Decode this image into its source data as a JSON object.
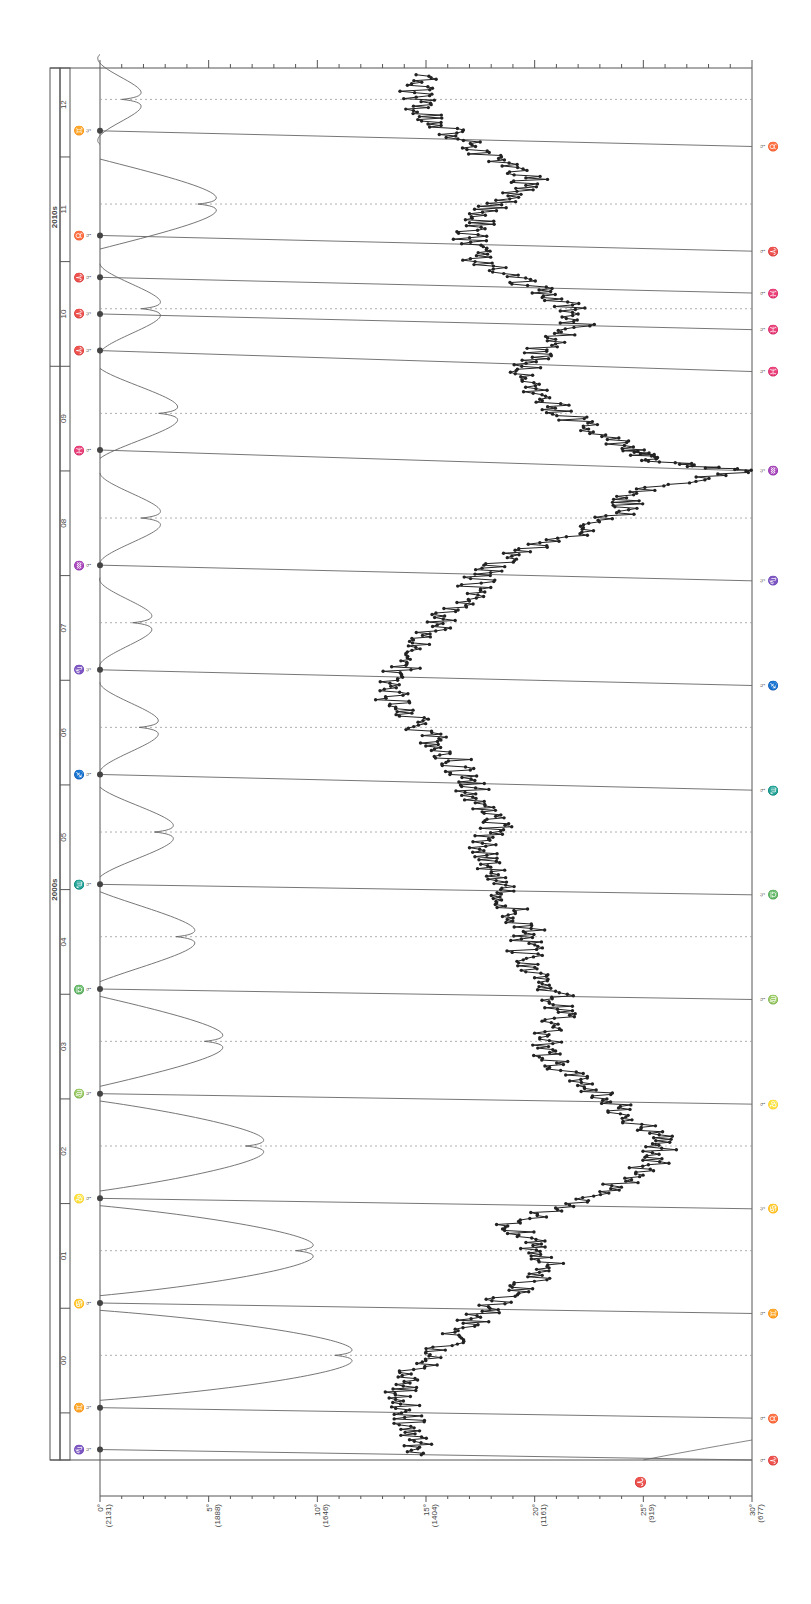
{
  "chart_data": {
    "type": "line",
    "orientation": "rotated-90",
    "title": "",
    "xlabel": "Year",
    "ylabel": "Degrees (price)",
    "decades": [
      {
        "label": "2000s",
        "from": 2000,
        "to": 2010
      },
      {
        "label": "2010s",
        "from": 2010,
        "to": 2013
      }
    ],
    "year_ticks": [
      "00",
      "01",
      "02",
      "03",
      "04",
      "05",
      "06",
      "07",
      "08",
      "09",
      "10",
      "11",
      "12"
    ],
    "y_ticks": [
      {
        "deg": "0°",
        "price": "(2131)"
      },
      {
        "deg": "5°",
        "price": "(1888)"
      },
      {
        "deg": "10°",
        "price": "(1646)"
      },
      {
        "deg": "15°",
        "price": "(1404)"
      },
      {
        "deg": "20°",
        "price": "(1161)"
      },
      {
        "deg": "25°",
        "price": "(919)"
      },
      {
        "deg": "30°",
        "price": "(677)"
      }
    ],
    "ylim": [
      0,
      30
    ],
    "xlim": [
      1999.55,
      2012.85
    ],
    "price_series": {
      "name": "Price (in degrees)",
      "x": [
        1999.6,
        1999.8,
        2000.0,
        2000.2,
        2000.4,
        2000.6,
        2000.8,
        2001.0,
        2001.2,
        2001.4,
        2001.6,
        2001.8,
        2002.0,
        2002.2,
        2002.4,
        2002.6,
        2002.8,
        2003.0,
        2003.2,
        2003.4,
        2003.6,
        2003.8,
        2004.0,
        2004.2,
        2004.4,
        2004.6,
        2004.8,
        2005.0,
        2005.2,
        2005.4,
        2005.6,
        2005.8,
        2006.0,
        2006.2,
        2006.4,
        2006.6,
        2006.8,
        2007.0,
        2007.2,
        2007.4,
        2007.6,
        2007.8,
        2008.0,
        2008.2,
        2008.4,
        2008.6,
        2008.8,
        2009.0,
        2009.1,
        2009.2,
        2009.4,
        2009.6,
        2009.8,
        2010.0,
        2010.2,
        2010.4,
        2010.6,
        2010.8,
        2011.0,
        2011.2,
        2011.4,
        2011.6,
        2011.8,
        2012.0,
        2012.2,
        2012.4,
        2012.6,
        2012.8
      ],
      "y": [
        14.8,
        14.5,
        14.0,
        13.8,
        14.5,
        15.5,
        16.8,
        17.8,
        19.5,
        21.0,
        20.0,
        19.0,
        21.5,
        24.0,
        25.5,
        26.0,
        24.5,
        23.5,
        21.8,
        20.5,
        20.5,
        21.2,
        21.0,
        20.3,
        19.5,
        19.8,
        19.0,
        18.5,
        18.0,
        17.8,
        18.2,
        17.6,
        17.0,
        16.5,
        15.5,
        14.5,
        13.5,
        13.2,
        14.5,
        15.0,
        15.8,
        17.0,
        17.5,
        19.0,
        22.0,
        24.0,
        24.5,
        29.5,
        25.5,
        24.5,
        22.5,
        21.0,
        20.0,
        19.5,
        20.5,
        22.0,
        21.5,
        19.5,
        17.5,
        17.0,
        17.5,
        18.5,
        20.0,
        17.8,
        16.5,
        15.0,
        14.5,
        15.0
      ]
    },
    "planet_markers_left": [
      {
        "year": 1999.65,
        "glyph": "♑"
      },
      {
        "year": 2000.05,
        "glyph": "♊"
      },
      {
        "year": 2001.05,
        "glyph": "♋"
      },
      {
        "year": 2002.05,
        "glyph": "♌"
      },
      {
        "year": 2003.05,
        "glyph": "♍"
      },
      {
        "year": 2004.05,
        "glyph": "♎"
      },
      {
        "year": 2005.05,
        "glyph": "♏"
      },
      {
        "year": 2006.1,
        "glyph": "♐"
      },
      {
        "year": 2007.1,
        "glyph": "♑"
      },
      {
        "year": 2008.1,
        "glyph": "♒"
      },
      {
        "year": 2009.2,
        "glyph": "♓"
      },
      {
        "year": 2010.15,
        "glyph": "♈"
      },
      {
        "year": 2010.5,
        "glyph": "♈"
      },
      {
        "year": 2010.85,
        "glyph": "♈"
      },
      {
        "year": 2011.25,
        "glyph": "♉"
      },
      {
        "year": 2012.25,
        "glyph": "♊"
      }
    ],
    "planet_markers_right": [
      {
        "year": 1999.55,
        "glyph": "♈"
      },
      {
        "year": 1999.95,
        "glyph": "♉"
      },
      {
        "year": 2000.95,
        "glyph": "♊"
      },
      {
        "year": 2001.95,
        "glyph": "♋"
      },
      {
        "year": 2002.95,
        "glyph": "♌"
      },
      {
        "year": 2003.95,
        "glyph": "♍"
      },
      {
        "year": 2004.95,
        "glyph": "♎"
      },
      {
        "year": 2005.95,
        "glyph": "♏"
      },
      {
        "year": 2006.95,
        "glyph": "♐"
      },
      {
        "year": 2007.95,
        "glyph": "♑"
      },
      {
        "year": 2009.0,
        "glyph": "♒"
      },
      {
        "year": 2009.95,
        "glyph": "♓"
      },
      {
        "year": 2010.35,
        "glyph": "♓"
      },
      {
        "year": 2010.7,
        "glyph": "♓"
      },
      {
        "year": 2011.1,
        "glyph": "♈"
      },
      {
        "year": 2012.1,
        "glyph": "♉"
      }
    ],
    "bottom_marker": {
      "deg": 25,
      "glyph": "♈"
    },
    "retrograde_loops": [
      {
        "year": 2000.55,
        "depth": 10.8,
        "side": "left"
      },
      {
        "year": 2001.55,
        "depth": 9.0,
        "side": "left"
      },
      {
        "year": 2002.55,
        "depth": 6.7,
        "side": "left"
      },
      {
        "year": 2003.55,
        "depth": 4.8,
        "side": "left"
      },
      {
        "year": 2004.55,
        "depth": 3.5,
        "side": "left"
      },
      {
        "year": 2005.55,
        "depth": 2.5,
        "side": "left"
      },
      {
        "year": 2006.55,
        "depth": 1.8,
        "side": "left"
      },
      {
        "year": 2007.55,
        "depth": 1.5,
        "side": "left"
      },
      {
        "year": 2008.55,
        "depth": 1.9,
        "side": "left"
      },
      {
        "year": 2009.55,
        "depth": 2.7,
        "side": "left"
      },
      {
        "year": 2010.55,
        "depth": 1.9,
        "side": "right"
      },
      {
        "year": 2011.55,
        "depth": 4.5,
        "side": "left"
      },
      {
        "year": 2012.55,
        "depth": 1.0,
        "side": "left"
      }
    ],
    "grid": false,
    "legend": "none"
  }
}
